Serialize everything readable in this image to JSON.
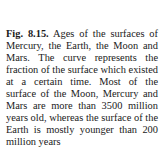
{
  "figure": {
    "label": "Fig. 8.15.",
    "caption": "Ages of the surfaces of Mercury, the Earth, the Moon and Mars. The curve represents the fraction of the surface which existed at a certain time. Most of the surface of the Moon, Mercury and Mars are more than 3500 million years old, whereas the surface of the Earth is mostly younger than 200 million years"
  }
}
